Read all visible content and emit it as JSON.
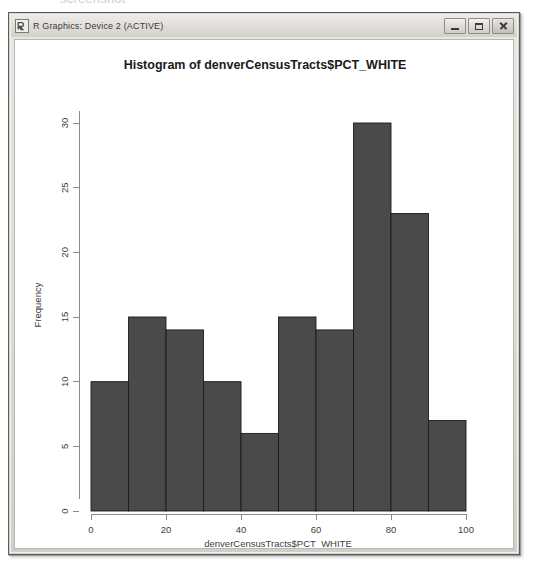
{
  "scan_artifact_text": "screenshot",
  "window": {
    "title": "R Graphics: Device 2 (ACTIVE)",
    "icon": "r-logo-icon",
    "buttons": [
      {
        "name": "minimize-button",
        "label": "Minimize",
        "glyph": "minimize"
      },
      {
        "name": "maximize-button",
        "label": "Maximize",
        "glyph": "maximize"
      },
      {
        "name": "close-button",
        "label": "Close",
        "glyph": "close"
      }
    ]
  },
  "colors": {
    "bar_fill": "#4a4a4a",
    "bar_stroke": "#1c1c1c",
    "axis": "#8a8a8a",
    "plot_background": "#ffffff",
    "window_chrome": "#d6d3ce"
  },
  "chart_data": {
    "type": "bar",
    "title": "Histogram of denverCensusTracts$PCT_WHITE",
    "xlabel": "denverCensusTracts$PCT_WHITE",
    "ylabel": "Frequency",
    "categories": [
      "0-10",
      "10-20",
      "20-30",
      "30-40",
      "40-50",
      "50-60",
      "60-70",
      "70-80",
      "80-90",
      "90-100"
    ],
    "bin_edges": [
      0,
      10,
      20,
      30,
      40,
      50,
      60,
      70,
      80,
      90,
      100
    ],
    "values": [
      10,
      15,
      14,
      10,
      6,
      15,
      14,
      30,
      23,
      7
    ],
    "xlim": [
      0,
      100
    ],
    "ylim": [
      0,
      30
    ],
    "xticks": [
      0,
      20,
      40,
      60,
      80,
      100
    ],
    "xtick_labels": [
      "0",
      "20",
      "40",
      "60",
      "80",
      "100"
    ],
    "yticks": [
      0,
      5,
      10,
      15,
      20,
      25,
      30
    ],
    "ytick_labels": [
      "0",
      "5",
      "10",
      "15",
      "20",
      "25",
      "30"
    ],
    "grid": false,
    "legend": false,
    "ytick_label_rotation": -90
  }
}
